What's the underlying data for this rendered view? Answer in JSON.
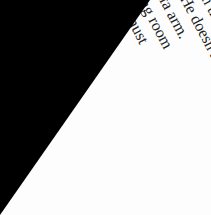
{
  "lines": [
    "er the pale yellow carpet,",
    "Queen's on the record",
    "vibrate. He doesn't",
    "rred sofa arm.",
    "h dining room",
    "ty. Kit must",
    "those bits",
    "would",
    "k as"
  ]
}
